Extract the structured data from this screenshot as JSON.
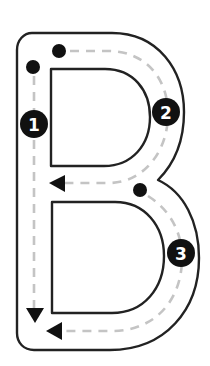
{
  "letter": "B",
  "colors": {
    "outline": "#222222",
    "guide": "#c4c4c4",
    "marker": "#111111",
    "badge_text": "#ffffff",
    "background": "#ffffff"
  },
  "strokes": [
    {
      "step": "1",
      "label": "1",
      "description": "Straight line down from top-left dot",
      "start_dot": [
        33,
        67
      ],
      "end_arrow": "down"
    },
    {
      "step": "2",
      "label": "2",
      "description": "Top curve from top dot around to middle",
      "start_dot": [
        59,
        51
      ],
      "end_arrow": "left"
    },
    {
      "step": "3",
      "label": "3",
      "description": "Bottom curve from middle dot around to bottom",
      "start_dot": [
        140,
        190
      ],
      "end_arrow": "left"
    }
  ]
}
